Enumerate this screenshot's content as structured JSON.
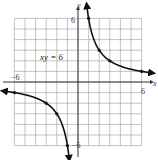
{
  "chart_data": {
    "type": "line",
    "title": "",
    "equation_label": "xy = 6",
    "xlabel": "x",
    "ylabel": "y",
    "xlim": [
      -6,
      6
    ],
    "ylim": [
      -6,
      6
    ],
    "grid": true,
    "tick_labels": {
      "x_min": "−6",
      "x_max": "6",
      "y_min": "−6",
      "y_max": "6"
    },
    "series": [
      {
        "name": "xy = 6 (quadrant I)",
        "points": [
          [
            1,
            6
          ],
          [
            2,
            3
          ],
          [
            3,
            2
          ],
          [
            6,
            1
          ]
        ],
        "arrow_ends": true
      },
      {
        "name": "xy = 6 (quadrant III)",
        "points": [
          [
            -6,
            -1
          ],
          [
            -3,
            -2
          ],
          [
            -2,
            -3
          ],
          [
            -1,
            -6
          ]
        ],
        "arrow_ends": true
      }
    ]
  }
}
